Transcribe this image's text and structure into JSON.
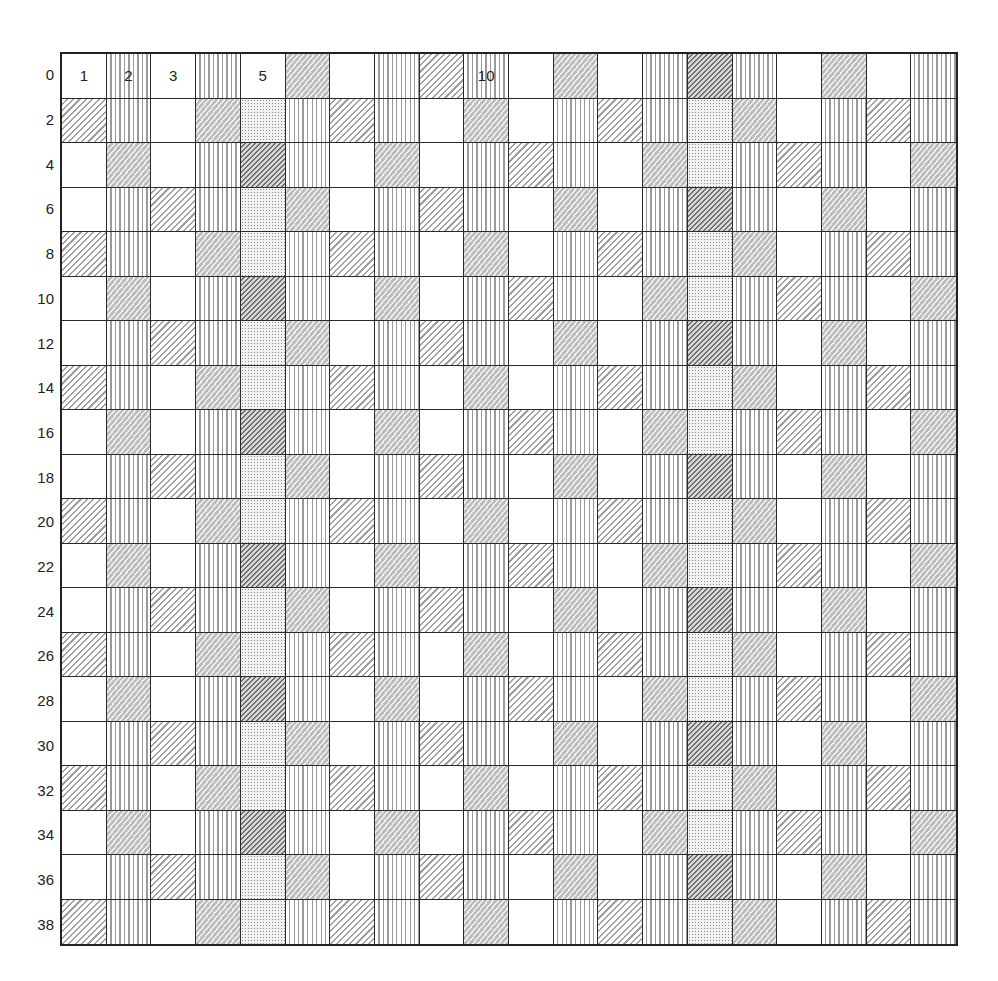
{
  "diagram": {
    "type": "patterned-grid",
    "columns": 20,
    "rows": 20,
    "legend_codes": {
      "B": "blank",
      "V": "vertical-lines",
      "D": "diagonal-lines",
      "DD": "dense-diagonal-hatch",
      "S": "stipple",
      "W": "dashed-diagonal-gray"
    },
    "row_labels": [
      "0",
      "2",
      "4",
      "6",
      "8",
      "10",
      "12",
      "14",
      "16",
      "18",
      "20",
      "22",
      "24",
      "26",
      "28",
      "30",
      "32",
      "34",
      "36",
      "38"
    ],
    "column_labels": [
      {
        "col": 0,
        "text": "1"
      },
      {
        "col": 1,
        "text": "2"
      },
      {
        "col": 2,
        "text": "3"
      },
      {
        "col": 4,
        "text": "5"
      },
      {
        "col": 9,
        "text": "10"
      }
    ],
    "row_patterns": {
      "row0": [
        "B",
        "V",
        "B",
        "V",
        "B",
        "W",
        "B",
        "V",
        "D",
        "V",
        "B",
        "W",
        "B",
        "V",
        "DD",
        "V",
        "B",
        "W",
        "B",
        "V"
      ],
      "A": [
        "D",
        "V",
        "B",
        "W",
        "S",
        "V",
        "D",
        "V",
        "B",
        "W",
        "B",
        "V",
        "D",
        "V",
        "S",
        "W",
        "B",
        "V",
        "D",
        "V"
      ],
      "B": [
        "B",
        "W",
        "B",
        "V",
        "DD",
        "V",
        "B",
        "W",
        "B",
        "V",
        "D",
        "V",
        "B",
        "W",
        "S",
        "V",
        "D",
        "V",
        "B",
        "W"
      ],
      "C": [
        "B",
        "V",
        "D",
        "V",
        "S",
        "W",
        "B",
        "V",
        "D",
        "V",
        "B",
        "W",
        "B",
        "V",
        "DD",
        "V",
        "B",
        "W",
        "B",
        "V"
      ]
    },
    "row_sequence": [
      "row0",
      "A",
      "B",
      "C",
      "A",
      "B",
      "C",
      "A",
      "B",
      "C",
      "A",
      "B",
      "C",
      "A",
      "B",
      "C",
      "A",
      "B",
      "C",
      "A"
    ]
  }
}
